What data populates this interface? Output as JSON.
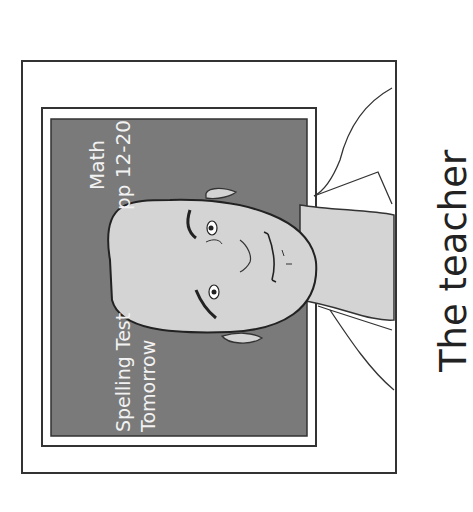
{
  "caption": "The teacher",
  "chalkboard": {
    "line1": "Math",
    "line2": "pp 12-20",
    "line3": "Spelling Test",
    "line4": "Tomorrow"
  },
  "colors": {
    "board": "#7a7a7a",
    "face": "#d4d4d4",
    "outline": "#333333",
    "chalk": "#f2f2f2"
  },
  "orientation": "rotated 90deg counter-clockwise"
}
